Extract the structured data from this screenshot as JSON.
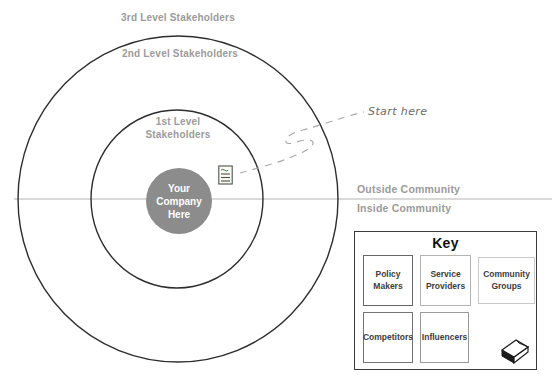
{
  "diagram": {
    "rings": [
      {
        "label": "3rd Level Stakeholders"
      },
      {
        "label": "2nd Level Stakeholders"
      },
      {
        "label": "1st Level Stakeholders"
      }
    ],
    "center": {
      "label": "Your Company Here"
    },
    "annotation": {
      "label": "Start here"
    },
    "boundary": {
      "outside": "Outside Community",
      "inside": "Inside Community"
    },
    "icons": {
      "memo": "memo-icon",
      "notes_stack": "notes-stack-icon"
    },
    "colors": {
      "ring_stroke": "#2d2d2d",
      "label_gray": "#9b9b9b",
      "center_fill": "#8c8c8c",
      "center_text": "#ffffff",
      "divider_line": "#b4b4b4",
      "dashed_connector": "#a9a9a9"
    }
  },
  "key": {
    "title": "Key",
    "items": [
      {
        "label": "Policy Makers",
        "border": "#666666"
      },
      {
        "label": "Service Providers",
        "border": "#b3b3b3"
      },
      {
        "label": "Community Groups",
        "border": "#c8c8c8"
      },
      {
        "label": "Competitors",
        "border": "#757575"
      },
      {
        "label": "Influencers",
        "border": "#999999"
      }
    ]
  }
}
